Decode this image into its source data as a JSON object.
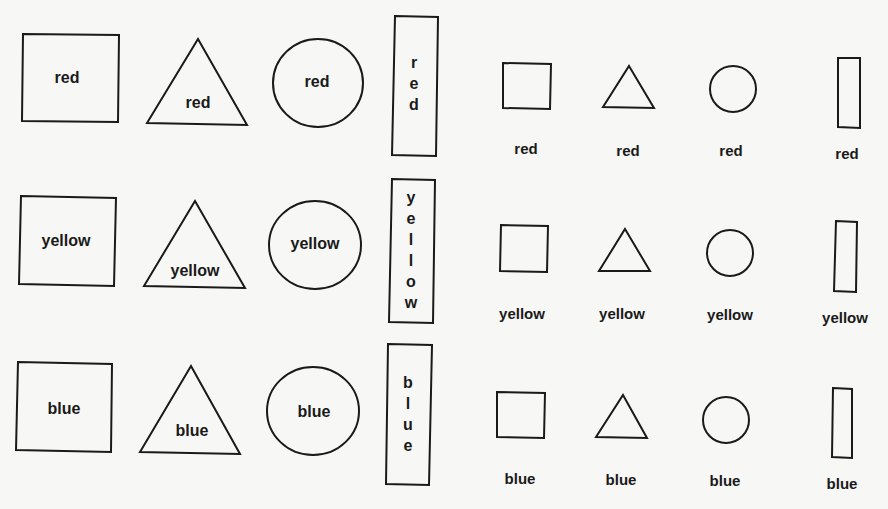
{
  "figure": {
    "rows": [
      {
        "color": "red",
        "left_group": {
          "square_label": "red",
          "triangle_label": "red",
          "circle_label": "red",
          "rectangle_label_letters": [
            "r",
            "e",
            "d"
          ]
        },
        "right_group": {
          "square_caption": "red",
          "triangle_caption": "red",
          "circle_caption": "red",
          "rectangle_caption": "red"
        }
      },
      {
        "color": "yellow",
        "left_group": {
          "square_label": "yellow",
          "triangle_label": "yellow",
          "circle_label": "yellow",
          "rectangle_label_letters": [
            "y",
            "e",
            "l",
            "l",
            "o",
            "w"
          ]
        },
        "right_group": {
          "square_caption": "yellow",
          "triangle_caption": "yellow",
          "circle_caption": "yellow",
          "rectangle_caption": "yellow"
        }
      },
      {
        "color": "blue",
        "left_group": {
          "square_label": "blue",
          "triangle_label": "blue",
          "circle_label": "blue",
          "rectangle_label_letters": [
            "b",
            "l",
            "u",
            "e"
          ]
        },
        "right_group": {
          "square_caption": "blue",
          "triangle_caption": "blue",
          "circle_caption": "blue",
          "rectangle_caption": "blue"
        }
      }
    ],
    "shape_order": [
      "square",
      "triangle",
      "circle",
      "rectangle"
    ],
    "stroke_color": "#1a1a1a",
    "background_color": "#f7f7f5"
  }
}
